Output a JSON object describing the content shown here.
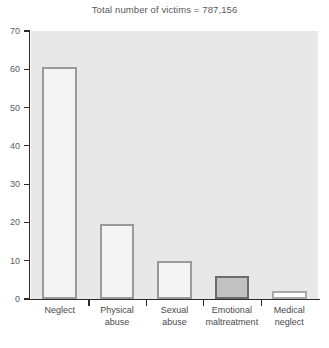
{
  "chart_data": {
    "type": "bar",
    "title": "Total number of victims = 787,156",
    "xlabel": "",
    "ylabel": "",
    "ylim": [
      0,
      70
    ],
    "yticks": [
      0,
      10,
      20,
      30,
      40,
      50,
      60,
      70
    ],
    "grid": false,
    "legend": "none",
    "categories": [
      "Neglect",
      "Physical\nabuse",
      "Sexual\nabuse",
      "Emotional\nmaltreatment",
      "Medical\nneglect"
    ],
    "values": [
      60.5,
      19.5,
      10.0,
      6.0,
      2.0
    ],
    "bar_styles": [
      "open",
      "open",
      "open",
      "filled",
      "open"
    ],
    "colors": {
      "plot_background": "#e8e8e8",
      "bar_fill": "#f4f4f4",
      "bar_border": "#9a9a9a",
      "highlight_fill": "#c2c2c2",
      "highlight_border": "#6c6c6c",
      "axis": "#2b2b2b",
      "text": "#59595b"
    }
  },
  "axis": {
    "y_labels": [
      "70",
      "60",
      "50",
      "40",
      "30",
      "20",
      "10",
      "0"
    ]
  }
}
